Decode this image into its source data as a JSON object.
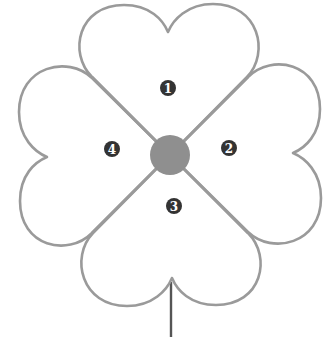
{
  "diagram": {
    "type": "four-leaf-clover",
    "colors": {
      "outline": "#9a9a9a",
      "center": "#8f8f8f",
      "stem": "#555555",
      "badge": "#333333",
      "badge_text": "#ffffff"
    },
    "leaves": [
      {
        "label": "1",
        "position": "top"
      },
      {
        "label": "2",
        "position": "right"
      },
      {
        "label": "3",
        "position": "bottom"
      },
      {
        "label": "4",
        "position": "left"
      }
    ]
  }
}
